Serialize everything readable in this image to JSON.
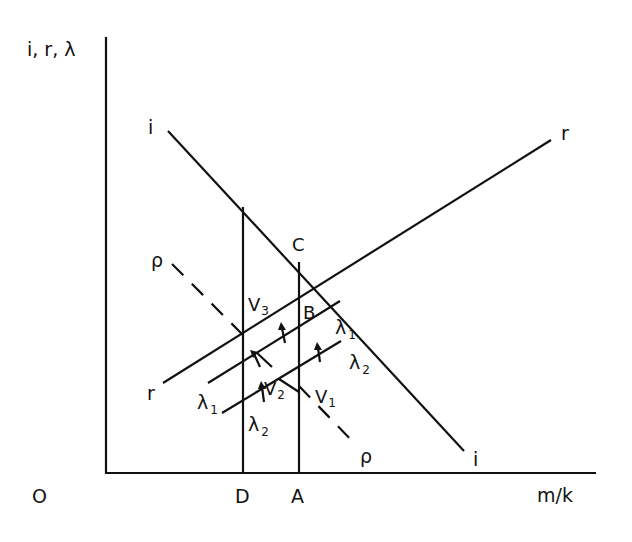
{
  "diagram": {
    "y_axis_label": "i, r, λ",
    "x_axis_label": "m/k",
    "origin_label": "O",
    "x_ticks": [
      "D",
      "A"
    ],
    "curves": [
      {
        "id": "i",
        "label_start": "i",
        "label_end": "i"
      },
      {
        "id": "r",
        "label_start": "r",
        "label_end": "r"
      },
      {
        "id": "lambda1",
        "label": "λ",
        "subscript": "1"
      },
      {
        "id": "lambda2",
        "label": "λ",
        "subscript": "2"
      },
      {
        "id": "rho",
        "label_start": "ρ",
        "label_end": "ρ"
      }
    ],
    "points": {
      "C": "C",
      "B": "B",
      "V3": {
        "base": "V",
        "sub": "3"
      },
      "V2": {
        "base": "V",
        "sub": "2"
      },
      "V1": {
        "base": "V",
        "sub": "1"
      }
    },
    "colors": {
      "ink": "#111111",
      "background": "#ffffff"
    }
  }
}
